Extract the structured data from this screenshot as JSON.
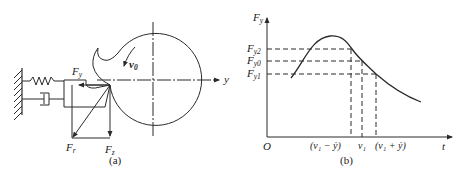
{
  "figure_a": {
    "caption": "(a)",
    "labels": {
      "fy": {
        "main": "F",
        "sub": "y"
      },
      "v0": {
        "main": "v",
        "sub": "0"
      },
      "y_axis": "y",
      "fr": {
        "main": "F",
        "sub": "r"
      },
      "fz": {
        "main": "F",
        "sub": "z"
      }
    },
    "components": [
      "fixed-wall",
      "spring",
      "damper",
      "cutting-tool",
      "workpiece-circle",
      "force-vectors"
    ]
  },
  "figure_b": {
    "caption": "(b)",
    "y_axis_label": {
      "main": "F",
      "sub": "y"
    },
    "x_axis_label": "t",
    "origin_label": "O",
    "y_ticks": [
      {
        "main": "F",
        "sub": "y2"
      },
      {
        "main": "F",
        "sub": "y0"
      },
      {
        "main": "F",
        "sub": "y1"
      }
    ],
    "x_ticks": [
      "(v₁ − ẏ)",
      "v₁",
      "(v₁ + ẏ)"
    ]
  },
  "colors": {
    "line": "#2a2a2a",
    "background": "#ffffff"
  }
}
